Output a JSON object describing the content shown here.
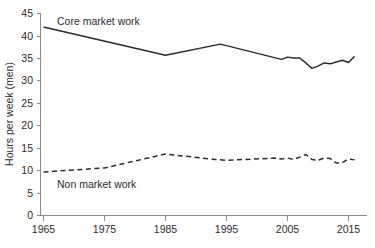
{
  "chart_data": {
    "type": "line",
    "title": "",
    "xlabel": "",
    "ylabel": "Hours per week (men)",
    "xlim": [
      1965,
      2016
    ],
    "ylim": [
      0,
      45
    ],
    "grid": false,
    "legend_position": "inline-annotation",
    "x_ticks": [
      "1965",
      "1975",
      "1985",
      "1995",
      "2005",
      "2015"
    ],
    "x_tick_values": [
      1965,
      1975,
      1985,
      1995,
      2005,
      2015
    ],
    "y_ticks": [
      "0",
      "5",
      "10",
      "15",
      "20",
      "25",
      "30",
      "35",
      "40",
      "45"
    ],
    "y_tick_values": [
      0,
      5,
      10,
      15,
      20,
      25,
      30,
      35,
      40,
      45
    ],
    "series": [
      {
        "name": "Core market work",
        "style": "solid",
        "color": "#2b2b2b",
        "x": [
          1965,
          1985,
          1994,
          2004,
          2005,
          2006,
          2007,
          2008,
          2009,
          2010,
          2011,
          2012,
          2013,
          2014,
          2015,
          2016
        ],
        "values": [
          42.0,
          35.7,
          38.2,
          34.8,
          35.3,
          35.1,
          35.1,
          34.0,
          32.8,
          33.3,
          34.0,
          33.8,
          34.2,
          34.6,
          34.1,
          35.5
        ]
      },
      {
        "name": "Non market work",
        "style": "dashed",
        "color": "#2b2b2b",
        "x": [
          1965,
          1975,
          1985,
          1993,
          1995,
          2003,
          2004,
          2005,
          2006,
          2007,
          2008,
          2009,
          2010,
          2011,
          2012,
          2013,
          2014,
          2015,
          2016
        ],
        "values": [
          9.7,
          10.6,
          13.7,
          12.5,
          12.3,
          12.8,
          12.6,
          12.8,
          12.5,
          13.0,
          13.6,
          12.5,
          12.3,
          12.8,
          12.7,
          11.7,
          11.8,
          12.6,
          12.4
        ]
      }
    ],
    "annotations": [
      {
        "text": "Core market work",
        "x_px": 57,
        "y_px": 25
      },
      {
        "text": "Non market work",
        "x_px": 57,
        "y_px": 188
      }
    ]
  },
  "axis": {
    "y_title": "Hours per week (men)"
  }
}
